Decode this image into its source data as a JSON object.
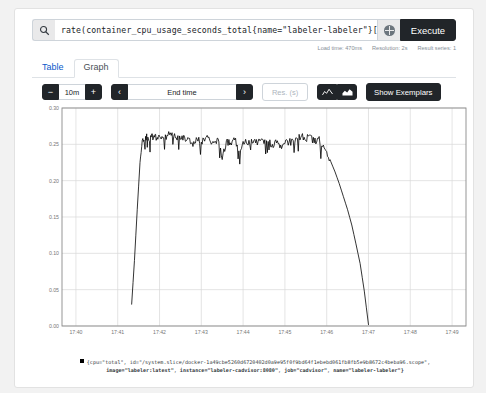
{
  "query": {
    "value": "rate(container_cpu_usage_seconds_total{name=\"labeler-labeler\"}[1m])",
    "placeholder": "Expression (press Shift+Enter for newlines)",
    "search_icon": "search-icon",
    "metrics_explorer_icon": "globe-icon",
    "execute_label": "Execute"
  },
  "meta": {
    "load_time": "Load time: 470ms",
    "resolution": "Resolution: 2s",
    "result_series": "Result series: 1"
  },
  "tabs": [
    {
      "label": "Table",
      "active": false
    },
    {
      "label": "Graph",
      "active": true
    }
  ],
  "controls": {
    "decrease_label": "−",
    "range_value": "10m",
    "increase_label": "+",
    "prev_label": "‹",
    "end_time_placeholder": "End time",
    "end_time_value": "End time",
    "next_label": "›",
    "res_placeholder": "Res. (s)",
    "res_value": "Res. (s)",
    "line_chart_icon": "line-chart-icon",
    "stacked_chart_icon": "stacked-area-chart-icon",
    "show_exemplars_label": "Show Exemplars"
  },
  "legend": {
    "line1": "{cpu=\"total\", id=\"/system.slice/docker-1a49cbe5260d6720402d0a9e95f0f9bd64f1ebebd061fb8fb5e9b8672c4beba96.scope\",",
    "line2_parts": [
      "image=\"labeler:latest\"",
      ", ",
      "instance=\"labeler-cadvisor:8080\"",
      ", ",
      "job=\"cadvisor\"",
      ", ",
      "name=\"labeler-labeler\"}"
    ],
    "swatch_color": "#000000"
  },
  "chart_data": {
    "type": "line",
    "title": "",
    "xlabel": "",
    "ylabel": "",
    "series_name": "{cpu=\"total\", id=\"/system.slice/docker-1a49cbe5260d6720402d0a9e95f0f9bd64f1ebebd061fb8fb5e9b8672c4beba96.scope\", image=\"labeler:latest\", instance=\"labeler-cadvisor:8080\", job=\"cadvisor\", name=\"labeler-labeler\"}",
    "line_color": "#000000",
    "grid": true,
    "legend_position": "bottom",
    "ylim": [
      0.0,
      0.3
    ],
    "ytick_labels": [
      "0.00",
      "0.05",
      "0.10",
      "0.15",
      "0.20",
      "0.25",
      "0.30"
    ],
    "ytick_values": [
      0.0,
      0.05,
      0.1,
      0.15,
      0.2,
      0.25,
      0.3
    ],
    "xtick_labels": [
      "17:40",
      "17:41",
      "17:42",
      "17:43",
      "17:44",
      "17:45",
      "17:46",
      "17:47",
      "17:48",
      "17:49"
    ],
    "xlim": [
      "17:39:40",
      "17:49:20"
    ],
    "x": [
      "17:41:20",
      "17:41:24",
      "17:41:28",
      "17:41:32",
      "17:41:36",
      "17:41:40",
      "17:41:44",
      "17:41:48",
      "17:41:52",
      "17:41:56",
      "17:42:00",
      "17:42:06",
      "17:42:12",
      "17:42:18",
      "17:42:24",
      "17:42:30",
      "17:42:36",
      "17:42:42",
      "17:42:48",
      "17:42:54",
      "17:43:00",
      "17:43:06",
      "17:43:12",
      "17:43:18",
      "17:43:24",
      "17:43:30",
      "17:43:36",
      "17:43:42",
      "17:43:48",
      "17:43:54",
      "17:44:00",
      "17:44:06",
      "17:44:12",
      "17:44:18",
      "17:44:24",
      "17:44:30",
      "17:44:36",
      "17:44:42",
      "17:44:48",
      "17:44:54",
      "17:45:00",
      "17:45:06",
      "17:45:12",
      "17:45:18",
      "17:45:24",
      "17:45:30",
      "17:45:36",
      "17:45:42",
      "17:45:48",
      "17:45:54",
      "17:46:00",
      "17:46:06",
      "17:46:12",
      "17:46:18",
      "17:46:24",
      "17:46:30",
      "17:46:36",
      "17:46:42",
      "17:46:48",
      "17:46:54",
      "17:47:00"
    ],
    "values": [
      0.03,
      0.09,
      0.16,
      0.225,
      0.258,
      0.261,
      0.258,
      0.26,
      0.262,
      0.258,
      0.261,
      0.259,
      0.262,
      0.266,
      0.259,
      0.257,
      0.26,
      0.258,
      0.247,
      0.257,
      0.253,
      0.259,
      0.256,
      0.252,
      0.258,
      0.229,
      0.255,
      0.252,
      0.256,
      0.241,
      0.254,
      0.25,
      0.257,
      0.252,
      0.255,
      0.251,
      0.254,
      0.25,
      0.252,
      0.249,
      0.251,
      0.253,
      0.255,
      0.258,
      0.262,
      0.255,
      0.263,
      0.252,
      0.258,
      0.247,
      0.24,
      0.226,
      0.212,
      0.196,
      0.178,
      0.16,
      0.139,
      0.113,
      0.086,
      0.048,
      0.002
    ],
    "annotations": []
  }
}
